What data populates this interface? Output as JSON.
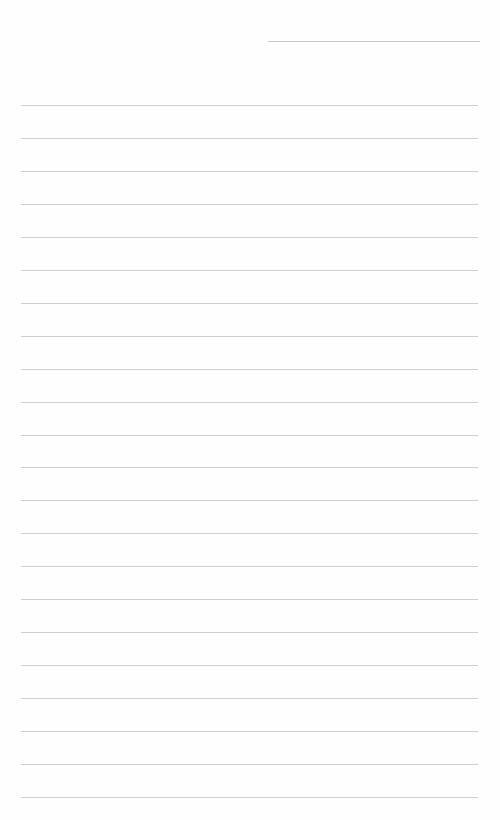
{
  "page": {
    "type": "lined-paper",
    "background": "#fefefe",
    "line_color": "#cfcfcf",
    "header_line": {
      "x1": 268,
      "x2": 480,
      "y": 41
    },
    "rules": {
      "count": 22,
      "first_y": 105,
      "spacing": 32.95,
      "x1": 21,
      "x2": 478
    }
  }
}
